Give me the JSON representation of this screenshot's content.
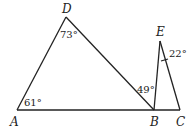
{
  "figure": {
    "points": {
      "A": {
        "label": "A",
        "x": 17,
        "y": 110
      },
      "B": {
        "label": "B",
        "x": 154,
        "y": 110
      },
      "C": {
        "label": "C",
        "x": 180,
        "y": 110
      },
      "D": {
        "label": "D",
        "x": 66,
        "y": 17
      },
      "E": {
        "label": "E",
        "x": 160,
        "y": 41
      }
    },
    "segments": [
      "AD",
      "DB",
      "AC",
      "BE",
      "EC"
    ],
    "angles": {
      "A": "61°",
      "D": "73°",
      "DBA": "49°",
      "E": "22°"
    },
    "colors": {
      "stroke": "#222222",
      "background": "#ffffff"
    }
  }
}
